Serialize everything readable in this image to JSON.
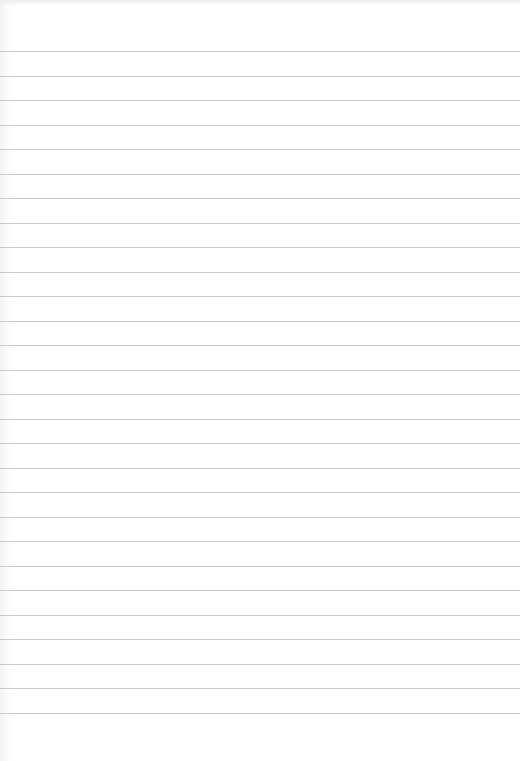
{
  "paper": {
    "type": "lined-paper",
    "line_color": "#c9c9c9",
    "background_color": "#ffffff",
    "first_line_y": 51,
    "line_spacing": 24.5,
    "line_count": 28
  }
}
